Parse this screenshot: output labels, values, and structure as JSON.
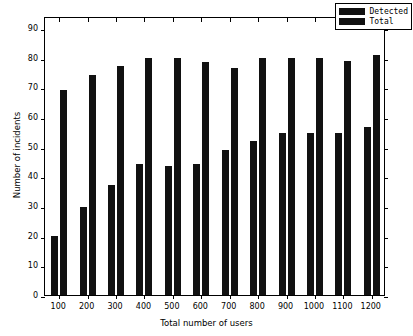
{
  "chart_data": {
    "type": "bar",
    "title": "",
    "xlabel": "Total number of users",
    "ylabel": "Number of incidents",
    "categories": [
      "100",
      "200",
      "300",
      "400",
      "500",
      "600",
      "700",
      "800",
      "900",
      "1000",
      "1100",
      "1200"
    ],
    "series": [
      {
        "name": "Detected",
        "color": "#111111",
        "values": [
          20,
          29.5,
          37,
          44,
          43.5,
          44,
          49,
          52,
          54.5,
          54.5,
          54.5,
          56.5
        ]
      },
      {
        "name": "Total",
        "color": "#111111",
        "values": [
          69,
          74,
          77,
          80,
          80,
          78.5,
          76.5,
          80,
          80,
          80,
          79,
          81
        ]
      }
    ],
    "ylim": [
      0,
      94
    ],
    "yticks": [
      0,
      10,
      20,
      30,
      40,
      50,
      60,
      70,
      80,
      90
    ],
    "ytick_labels": [
      "0",
      "10",
      "20",
      "30",
      "40",
      "50",
      "60",
      "70",
      "80",
      "90"
    ],
    "xtick_labels": [
      "100",
      "200",
      "300",
      "400",
      "500",
      "600",
      "700",
      "800",
      "900",
      "1000",
      "1100",
      "1200"
    ],
    "grid": false,
    "legend_position": "upper right",
    "legend_entries": [
      "Detected",
      "Total"
    ]
  }
}
